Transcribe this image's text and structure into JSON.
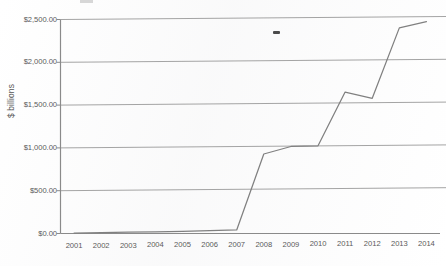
{
  "chart_data": {
    "type": "line",
    "title": "",
    "xlabel": "",
    "ylabel": "$ billions",
    "categories": [
      "2001",
      "2002",
      "2003",
      "2004",
      "2005",
      "2006",
      "2007",
      "2008",
      "2009",
      "2010",
      "2011",
      "2012",
      "2013",
      "2014"
    ],
    "values": [
      5,
      8,
      10,
      12,
      15,
      20,
      25,
      910,
      995,
      1000,
      1625,
      1550,
      2370,
      2440
    ],
    "series": [
      {
        "name": "",
        "values": [
          5,
          8,
          10,
          12,
          15,
          20,
          25,
          910,
          995,
          1000,
          1625,
          1550,
          2370,
          2440
        ]
      }
    ],
    "ylim": [
      0,
      2500
    ],
    "y_ticks": [
      0,
      500,
      1000,
      1500,
      2000,
      2500
    ],
    "y_tick_labels": [
      "$0.00",
      "$500.00",
      "$1,000.00",
      "$1,500.00",
      "$2,000.00",
      "$2,500.00"
    ],
    "grid": true,
    "legend": "none",
    "line_color": "#808080",
    "grid_color": "#9a9a9a",
    "axis_color": "#8a8a8a",
    "background_color": "#ffffff"
  }
}
